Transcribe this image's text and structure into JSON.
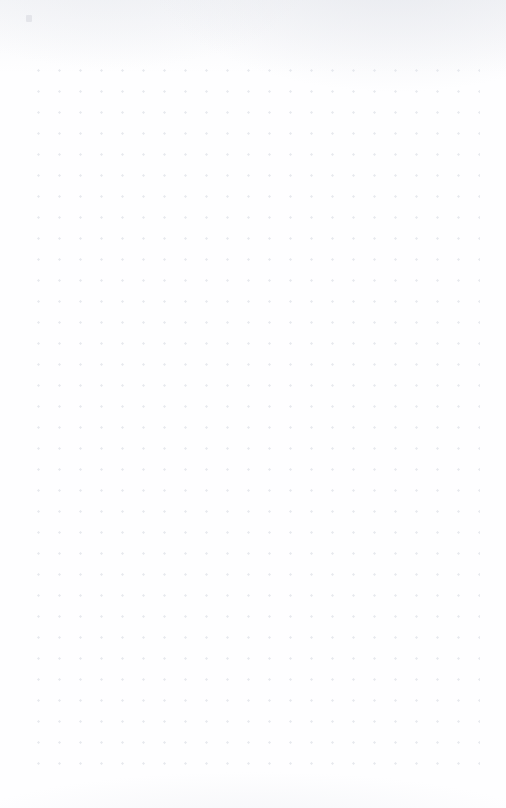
{
  "page": {
    "kind": "dot-grid-notebook-page",
    "width": 506,
    "height": 808,
    "background_color": "#fefeff",
    "has_text": false,
    "has_handwriting": false,
    "content_summary": "Blank dot-grid (bullet journal) paper page with no written content",
    "visible_text": ""
  },
  "grid": {
    "spacing_px": 21,
    "dot_color": "#e7e9ee",
    "dot_radius_px": 0.9,
    "origin_x_px": 28,
    "origin_y_px": 60,
    "columns": 22,
    "rows": 34,
    "extent_width_px": 451,
    "extent_height_px": 715,
    "margin_left_px": 28,
    "margin_right_px": 28,
    "margin_top_px": 60,
    "margin_bottom_px": 48
  },
  "artifacts": {
    "scan_mark_label": "",
    "texture_color": "#eceef2"
  }
}
